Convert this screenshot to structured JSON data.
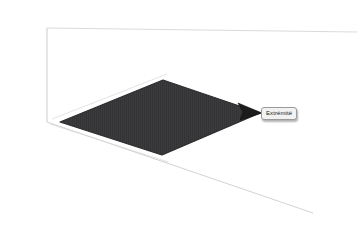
{
  "viewport": {
    "name": "3d-cad-viewport",
    "background_color": "#ffffff",
    "width": 362,
    "height": 230
  },
  "axes": {
    "color": "#c8c8c8",
    "vertical_axis_label": "",
    "origin_x": 47,
    "origin_y": 122
  },
  "selection": {
    "label": "Extrémité",
    "fill_color": "#3b3b3d",
    "edge_color": "#2c2c2e",
    "shape": "quadrilateral",
    "corners": [
      {
        "x": 60,
        "y": 122
      },
      {
        "x": 163,
        "y": 80
      },
      {
        "x": 260,
        "y": 113
      },
      {
        "x": 162,
        "y": 155
      }
    ]
  },
  "tooltip": {
    "text": "Extrémité",
    "background_color": "#f2f2f2",
    "border_color": "#9a9a9a",
    "text_color": "#1a1a1a"
  },
  "pointer": {
    "name": "cursor-arrow",
    "tip_x": 238,
    "tip_y": 103,
    "color": "#1c1c1c"
  },
  "construction_lines": [
    {
      "name": "z-axis",
      "x1": 47,
      "y1": 28,
      "x2": 47,
      "y2": 122
    },
    {
      "name": "upper-right-edge",
      "x1": 47,
      "y1": 28,
      "x2": 357,
      "y2": 32
    },
    {
      "name": "lower-right-edge",
      "x1": 47,
      "y1": 122,
      "x2": 313,
      "y2": 213
    },
    {
      "name": "face-top-left-edge",
      "x1": 60,
      "y1": 122,
      "x2": 163,
      "y2": 80
    },
    {
      "name": "face-bottom-left-edge",
      "x1": 60,
      "y1": 122,
      "x2": 162,
      "y2": 155
    }
  ]
}
